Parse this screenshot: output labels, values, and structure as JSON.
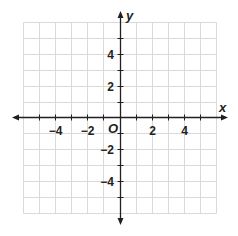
{
  "figure": {
    "x_axis_label": "x",
    "y_axis_label": "y",
    "origin_label": "O",
    "x_tick_labels": [
      "−4",
      "−2",
      "2",
      "4"
    ],
    "y_tick_labels": [
      "4",
      "2",
      "−2",
      "−4"
    ],
    "x_range": [
      -6,
      6
    ],
    "y_range": [
      -6,
      6
    ],
    "grid": true,
    "grid_color": "#d9d9d9",
    "axis_color": "#231f20"
  }
}
